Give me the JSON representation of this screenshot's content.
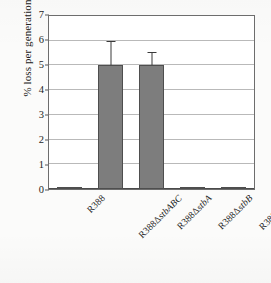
{
  "chart_data": {
    "type": "bar",
    "title": "",
    "xlabel": "",
    "ylabel": "% loss per generation",
    "ylim": [
      0,
      7
    ],
    "yticks": [
      0,
      1,
      2,
      3,
      4,
      5,
      6,
      7
    ],
    "grid": true,
    "legend": false,
    "categories": [
      "R388",
      "R388ΔstbABC",
      "R388ΔstbA",
      "R388ΔstbB",
      "R388ΔstbC"
    ],
    "category_parts": [
      {
        "plain": "R388",
        "italic": ""
      },
      {
        "plain": "R388Δ",
        "italic": "stbABC"
      },
      {
        "plain": "R388Δ",
        "italic": "stbA"
      },
      {
        "plain": "R388Δ",
        "italic": "stbB"
      },
      {
        "plain": "R388Δ",
        "italic": "stbC"
      }
    ],
    "values": [
      0.05,
      5.0,
      5.0,
      0.03,
      0.02
    ],
    "errors": [
      0.0,
      0.95,
      0.5,
      0.0,
      0.0
    ],
    "bar_color": "#7d7d7d",
    "bar_edge_color": "#4e4e4e",
    "error_color": "#3a3a3a",
    "grid_color": "#b9b9b9",
    "axis_color": "#6d6d6d"
  },
  "axis": {
    "y_title": "% loss per generation",
    "tick_labels": [
      "7",
      "6",
      "5",
      "4",
      "3",
      "2",
      "1",
      "0"
    ]
  }
}
